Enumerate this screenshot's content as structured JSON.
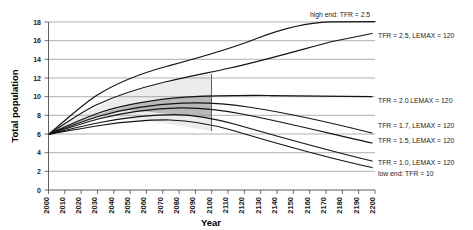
{
  "chart_data": {
    "type": "line",
    "title": "",
    "xlabel": "Year",
    "ylabel": "Total population",
    "xlim": [
      2000,
      2200
    ],
    "ylim": [
      0,
      18
    ],
    "ytick_step": 2,
    "xtick_step": 10,
    "grid": true,
    "legend_position": "inline-right-of-curve-ends",
    "xticks": [
      "2000",
      "2010",
      "2020",
      "2030",
      "2040",
      "2050",
      "2060",
      "2070",
      "2080",
      "2090",
      "2100",
      "2110",
      "2120",
      "2130",
      "2140",
      "2150",
      "2160",
      "2170",
      "2180",
      "2190",
      "2200"
    ],
    "yticks": [
      "0",
      "2",
      "4",
      "6",
      "8",
      "10",
      "12",
      "14",
      "16",
      "18"
    ],
    "start_value": 6.1,
    "projection_band_end_year": 2100,
    "bands": [
      {
        "name": "outer-uncertainty-band",
        "color": "#ececec",
        "end_year": 2100,
        "upper_bound_label": "high-variant envelope",
        "lower_bound_label": "low-variant envelope"
      },
      {
        "name": "inner-uncertainty-band",
        "color": "#b9b9b9",
        "end_year": 2100,
        "upper_bound_label": "mid-high envelope",
        "lower_bound_label": "mid-low envelope"
      }
    ],
    "series": [
      {
        "name": "high end: TFR = 2.5",
        "label": "high end: TFR = 2.5",
        "x": [
          2000,
          2020,
          2040,
          2060,
          2080,
          2100,
          2120,
          2140,
          2160,
          2180,
          2200
        ],
        "values": [
          6.1,
          7.9,
          9.6,
          11.1,
          12.2,
          13.0,
          15.0,
          16.6,
          17.5,
          17.9,
          18.0
        ]
      },
      {
        "name": "TFR = 2.5, LEMAX = 120",
        "label": "TFR = 2.5, LEMAX = 120",
        "x": [
          2000,
          2020,
          2040,
          2060,
          2080,
          2100,
          2120,
          2140,
          2160,
          2180,
          2200
        ],
        "values": [
          6.1,
          7.6,
          9.0,
          10.1,
          11.0,
          11.7,
          12.7,
          13.7,
          14.7,
          15.7,
          16.5
        ]
      },
      {
        "name": "TFR = 2.0, LEMAX = 120",
        "label": "TFR = 2.0.LEMAX = 120",
        "x": [
          2000,
          2020,
          2040,
          2060,
          2080,
          2100,
          2120,
          2140,
          2160,
          2180,
          2200
        ],
        "values": [
          6.1,
          7.4,
          8.5,
          9.3,
          9.9,
          10.2,
          10.2,
          10.1,
          10.0,
          9.9,
          9.8
        ]
      },
      {
        "name": "TFR = 1.7, LEMAX = 120",
        "label": "TFR = 1.7, LEMAX = 120",
        "x": [
          2000,
          2020,
          2040,
          2060,
          2080,
          2100,
          2120,
          2140,
          2160,
          2180,
          2200
        ],
        "values": [
          6.1,
          7.3,
          8.2,
          8.8,
          9.1,
          9.2,
          8.8,
          8.2,
          7.5,
          6.8,
          6.1
        ]
      },
      {
        "name": "TFR = 1.5, LEMAX = 120",
        "label": "TFR = 1.5, LEMAX = 120",
        "x": [
          2000,
          2020,
          2040,
          2060,
          2080,
          2100,
          2120,
          2140,
          2160,
          2180,
          2200
        ],
        "values": [
          6.1,
          7.2,
          8.0,
          8.5,
          8.7,
          8.6,
          8.0,
          7.3,
          6.5,
          5.7,
          5.0
        ]
      },
      {
        "name": "TFR = 1.0, LEMAX = 120",
        "label": "TFR = 1.0, LEMAX = 120",
        "x": [
          2000,
          2020,
          2040,
          2060,
          2080,
          2100,
          2120,
          2140,
          2160,
          2180,
          2200
        ],
        "values": [
          6.1,
          7.0,
          7.6,
          7.8,
          7.6,
          7.2,
          6.3,
          5.4,
          4.5,
          3.7,
          3.0
        ]
      },
      {
        "name": "low end: TFR = 10",
        "label": "low end: TFR = 10",
        "x": [
          2000,
          2020,
          2040,
          2060,
          2080,
          2100,
          2120,
          2140,
          2160,
          2180,
          2200
        ],
        "values": [
          6.1,
          6.9,
          7.3,
          7.3,
          7.0,
          6.5,
          5.6,
          4.7,
          3.9,
          3.1,
          2.3
        ]
      }
    ],
    "colors": {
      "curve": "#141414",
      "gridline": "#8c8c8c",
      "axis": "#4d4d4d",
      "band_outer": "#ececec",
      "band_inner": "#b9b9b9",
      "background": "#ffffff"
    }
  }
}
